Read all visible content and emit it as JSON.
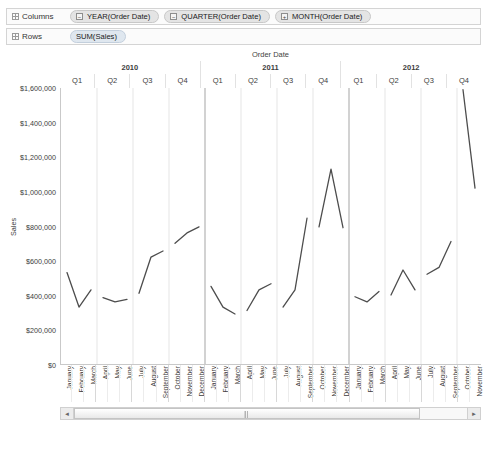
{
  "shelves": {
    "columns": {
      "label": "Columns",
      "pills": [
        {
          "toggle": "−",
          "text": "YEAR(Order Date)"
        },
        {
          "toggle": "−",
          "text": "QUARTER(Order Date)"
        },
        {
          "toggle": "+",
          "text": "MONTH(Order Date)"
        }
      ]
    },
    "rows": {
      "label": "Rows",
      "pills": [
        {
          "toggle": "",
          "text": "SUM(Sales)"
        }
      ]
    }
  },
  "chart_data": {
    "type": "line",
    "title": "Order Date",
    "xlabel": "Order Date",
    "ylabel": "Sales",
    "ylim": [
      0,
      1600000
    ],
    "ytick_values": [
      0,
      200000,
      400000,
      600000,
      800000,
      1000000,
      1200000,
      1400000,
      1600000
    ],
    "ytick_labels": [
      "$0",
      "$200,000",
      "$400,000",
      "$600,000",
      "$800,000",
      "$1,000,000",
      "$1,200,000",
      "$1,400,000",
      "$1,600,000"
    ],
    "grid": true,
    "legend": "none",
    "line_color": "#4d4d4d",
    "years": [
      "2010",
      "2011",
      "2012"
    ],
    "quarters": [
      "Q1",
      "Q2",
      "Q3",
      "Q4"
    ],
    "months": [
      "January",
      "February",
      "March",
      "April",
      "May",
      "June",
      "July",
      "August",
      "September",
      "October",
      "November",
      "December"
    ],
    "break_lines_at_quarter": true,
    "categories": [
      "2010 January",
      "2010 February",
      "2010 March",
      "2010 April",
      "2010 May",
      "2010 June",
      "2010 July",
      "2010 August",
      "2010 September",
      "2010 October",
      "2010 November",
      "2010 December",
      "2011 January",
      "2011 February",
      "2011 March",
      "2011 April",
      "2011 May",
      "2011 June",
      "2011 July",
      "2011 August",
      "2011 September",
      "2011 October",
      "2011 November",
      "2011 December",
      "2012 January",
      "2012 February",
      "2012 March",
      "2012 April",
      "2012 May",
      "2012 June",
      "2012 July",
      "2012 August",
      "2012 September",
      "2012 October",
      "2012 November"
    ],
    "values": [
      530000,
      330000,
      430000,
      385000,
      360000,
      375000,
      410000,
      620000,
      655000,
      700000,
      760000,
      795000,
      450000,
      330000,
      290000,
      310000,
      430000,
      465000,
      330000,
      430000,
      845000,
      795000,
      1130000,
      790000,
      390000,
      360000,
      420000,
      400000,
      545000,
      430000,
      520000,
      560000,
      710000,
      1590000,
      1020000
    ]
  },
  "scrollbar": {
    "left_arrow": "◄",
    "right_arrow": "►"
  }
}
